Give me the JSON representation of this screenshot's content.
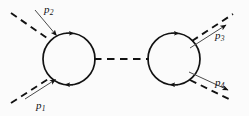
{
  "figure": {
    "background_color": "#fbfbfb",
    "line_color": "#121212",
    "width": 249,
    "height": 116
  },
  "labels": {
    "p1": {
      "base": "p",
      "sub": "1",
      "text": "p1"
    },
    "p2": {
      "base": "p",
      "sub": "2",
      "text": "p2"
    },
    "p3": {
      "base": "p",
      "sub": "3",
      "text": "p3"
    },
    "p4": {
      "base": "p",
      "sub": "4",
      "text": "p4"
    }
  },
  "diagram_data": {
    "type": "feynman-diagram",
    "loops": [
      {
        "name": "left-loop",
        "cx": 69,
        "cy": 59,
        "r": 26,
        "arrow_direction": "clockwise",
        "arrow_positions": [
          "top",
          "bottom"
        ]
      },
      {
        "name": "right-loop",
        "cx": 174,
        "cy": 59,
        "r": 26,
        "arrow_direction": "clockwise",
        "arrow_positions": [
          "top",
          "bottom"
        ]
      }
    ],
    "internal_propagator": {
      "name": "middle-dashed-propagator",
      "style": "dashed",
      "from": [
        95,
        59
      ],
      "to": [
        148,
        59
      ]
    },
    "external_legs": [
      {
        "name": "leg-p2",
        "label": "p2",
        "direction": "incoming",
        "attach": [
          51,
          41
        ],
        "outer": [
          12,
          10
        ],
        "solid_arrow": true,
        "dashed_partner": true
      },
      {
        "name": "leg-p1",
        "label": "p1",
        "direction": "incoming",
        "attach": [
          51,
          78
        ],
        "outer": [
          12,
          106
        ],
        "solid_arrow": true,
        "dashed_partner": true
      },
      {
        "name": "leg-p3",
        "label": "p3",
        "direction": "outgoing",
        "attach": [
          192,
          41
        ],
        "outer": [
          232,
          12
        ],
        "solid_arrow": true,
        "dashed_partner": true
      },
      {
        "name": "leg-p4",
        "label": "p4",
        "direction": "outgoing",
        "attach": [
          192,
          78
        ],
        "outer": [
          232,
          100
        ],
        "solid_arrow": true,
        "dashed_partner": true
      }
    ]
  }
}
